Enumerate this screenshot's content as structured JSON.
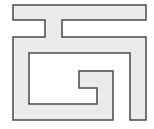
{
  "figure": {
    "fill_color": "#ebebeb",
    "stroke_color": "#4a4a4a",
    "background": "#ffffff",
    "path": "M13,5 L146,5 L146,20 L62,20 L62,37 L146,37 L146,120 L130,120 L130,53 L29,53 L29,104 L97,104 L97,88 L79,88 L79,71 L113,71 L113,120 L13,120 L13,37 L45,37 L45,20 L13,20 Z"
  }
}
